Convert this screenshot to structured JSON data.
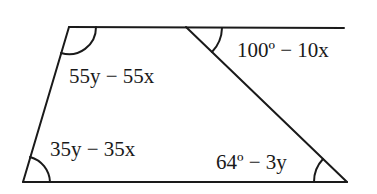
{
  "diagram": {
    "type": "geometry-trapezoid-with-transversal",
    "stroke_color": "#1a1a1a",
    "background": "#ffffff",
    "angle_labels": {
      "top_left": "55y − 55x",
      "top_exterior": "100º − 10x",
      "bottom_left": "35y − 35x",
      "bottom_right": "64º − 3y"
    }
  }
}
